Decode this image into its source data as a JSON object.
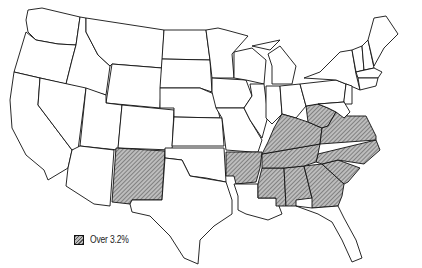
{
  "map": {
    "type": "choropleth",
    "region": "United States (contiguous)",
    "shade_pattern": "diagonal-hatch",
    "shade_color": "#8a8a8a",
    "outline_color": "#111111",
    "shaded_states": [
      "New Mexico",
      "Arkansas",
      "Mississippi",
      "Alabama",
      "Georgia",
      "South Carolina",
      "North Carolina",
      "Tennessee",
      "Kentucky",
      "West Virginia",
      "Virginia"
    ]
  },
  "legend": {
    "items": [
      {
        "label": "Over 3.2%",
        "pattern": "diagonal-hatch"
      }
    ]
  }
}
